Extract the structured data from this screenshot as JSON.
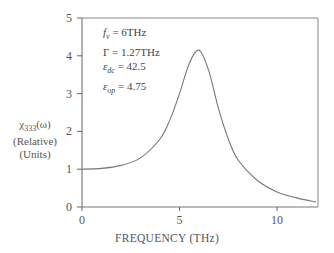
{
  "chart_data": {
    "type": "line",
    "title": "",
    "xlabel": "FREQUENCY (THz)",
    "ylabel": [
      "χ333(ω)",
      "(Relative)",
      "(Units)"
    ],
    "xlim": [
      0,
      12.1
    ],
    "ylim": [
      0,
      5
    ],
    "x_ticks": [
      "0",
      "5",
      "10"
    ],
    "y_ticks": [
      "0",
      "1",
      "2",
      "3",
      "4",
      "5"
    ],
    "grid": false,
    "legend": null,
    "annotations": [
      "f_v = 6THz",
      "Γ = 1.27THz",
      "ε_dc = 42.5",
      "ε_op = 4.75"
    ],
    "series": [
      {
        "name": "χ333 relative",
        "x": [
          0,
          1,
          2,
          3,
          4,
          4.5,
          5,
          5.5,
          6,
          6.5,
          7,
          7.5,
          8,
          9,
          10,
          11,
          12
        ],
        "values": [
          1.0,
          1.02,
          1.1,
          1.3,
          1.8,
          2.3,
          3.0,
          3.8,
          4.15,
          3.6,
          2.6,
          1.8,
          1.25,
          0.7,
          0.4,
          0.24,
          0.13
        ]
      }
    ]
  },
  "labels": {
    "ylabel_line1": "χ",
    "ylabel_sub": "333",
    "ylabel_line1_tail": "(ω)",
    "ylabel_line2": "(Relative)",
    "ylabel_line3": "(Units)",
    "xlabel": "FREQUENCY (THz)",
    "param_fv_sym": "f",
    "param_fv_sub": "v",
    "param_fv_val": " = 6THz",
    "param_gamma_sym": "Γ",
    "param_gamma_val": " = 1.27THz",
    "param_edc_sym": "ε",
    "param_edc_sub": "dc",
    "param_edc_val": " = 42.5",
    "param_eop_sym": "ε",
    "param_eop_sub": "op",
    "param_eop_val": " = 4.75"
  },
  "ticks": {
    "y": [
      "0",
      "1",
      "2",
      "3",
      "4",
      "5"
    ],
    "x": [
      "0",
      "5",
      "10"
    ]
  }
}
